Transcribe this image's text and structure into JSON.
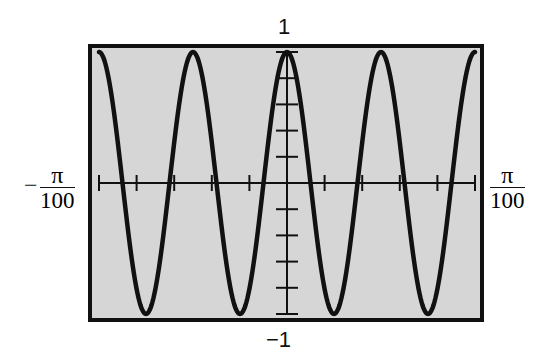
{
  "chart_data": {
    "type": "line",
    "title": "",
    "function": "cos(400x)",
    "xlabel": "",
    "ylabel": "",
    "xlim_labels": {
      "min": "-π/100",
      "max": "π/100"
    },
    "xlim": [
      -0.0314159,
      0.0314159
    ],
    "ylim": [
      -1,
      1
    ],
    "ylim_labels": {
      "max": "1",
      "min": "−1"
    },
    "x_ticks_count": 10,
    "y_ticks_count": 10,
    "grid": false,
    "legend": null,
    "background": "#d4d4d4",
    "line_color": "#111111",
    "series": [
      {
        "name": "y = cos(400x)",
        "x": [
          -0.0314,
          -0.0236,
          -0.0157,
          -0.0079,
          0,
          0.0079,
          0.0157,
          0.0236,
          0.0314
        ],
        "values": [
          1,
          -1,
          1,
          -1,
          1,
          -1,
          1,
          -1,
          1
        ]
      }
    ]
  },
  "labels": {
    "y_max": "1",
    "y_min": "−1",
    "x_min_sign": "−",
    "x_min_num": "π",
    "x_min_den": "100",
    "x_max_num": "π",
    "x_max_den": "100"
  }
}
